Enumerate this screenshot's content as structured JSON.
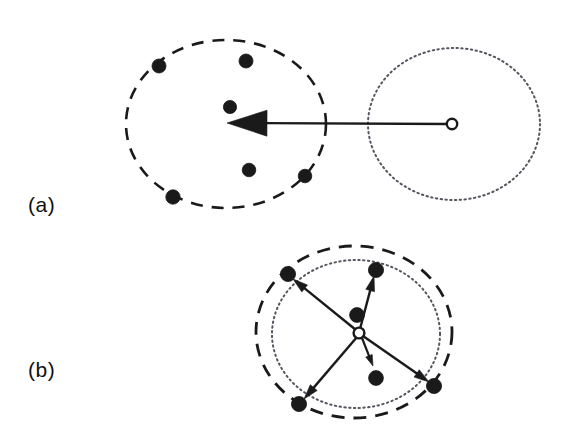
{
  "figure": {
    "width": 566,
    "height": 442,
    "background": "#ffffff",
    "ink_color": "#1a1a1a",
    "dotted_color": "#55555f"
  },
  "panels": [
    {
      "id": "panel-a",
      "label": "(a)",
      "label_position": {
        "x": 28,
        "y": 193
      },
      "description": "particle swarm inside dashed boundary with single long arrow from open circle at right toward swarm centre",
      "dashed_circle": {
        "name": "swarm-boundary-dashed",
        "cx": 226,
        "cy": 124,
        "rx": 100,
        "ry": 84,
        "stroke": "#1a1a1a",
        "stroke_width": 2.6,
        "dash": "12 9",
        "style": "dashed"
      },
      "dotted_circle": {
        "name": "target-boundary-dotted",
        "cx": 454,
        "cy": 124,
        "rx": 86,
        "ry": 76,
        "stroke": "#55555f",
        "stroke_width": 2.0,
        "dash": "1.4 3.4",
        "style": "dotted"
      },
      "open_circle": {
        "name": "reference-point-open-circle",
        "cx": 452,
        "cy": 124,
        "r": 5.2,
        "stroke": "#1a1a1a",
        "stroke_width": 2.4,
        "fill": "#ffffff"
      },
      "arrows": [
        {
          "name": "velocity-arrow-main",
          "x1": 447,
          "y1": 124,
          "x2": 227,
          "y2": 123,
          "stroke_width": 2.4,
          "head_length": 40,
          "head_width": 26
        }
      ],
      "particles": [
        {
          "name": "particle-1",
          "cx": 159,
          "cy": 66,
          "r": 7.0
        },
        {
          "name": "particle-2",
          "cx": 246,
          "cy": 61,
          "r": 7.0
        },
        {
          "name": "particle-3",
          "cx": 230,
          "cy": 107,
          "r": 6.6
        },
        {
          "name": "particle-4",
          "cx": 249,
          "cy": 170,
          "r": 6.8
        },
        {
          "name": "particle-5",
          "cx": 305,
          "cy": 176,
          "r": 6.8
        },
        {
          "name": "particle-6",
          "cx": 173,
          "cy": 197,
          "r": 7.2
        }
      ]
    },
    {
      "id": "panel-b",
      "label": "(b)",
      "label_position": {
        "x": 28,
        "y": 358
      },
      "description": "particles spread on overlapping dashed and dotted boundaries with five arrows radiating outward from central open circle",
      "dashed_circle": {
        "name": "swarm-boundary-dashed",
        "cx": 354,
        "cy": 332,
        "rx": 98,
        "ry": 86,
        "stroke": "#1a1a1a",
        "stroke_width": 2.8,
        "dash": "13 9",
        "style": "dashed"
      },
      "dotted_circle": {
        "name": "target-boundary-dotted",
        "cx": 356,
        "cy": 334,
        "rx": 84,
        "ry": 74,
        "stroke": "#55555f",
        "stroke_width": 2.0,
        "dash": "1.4 3.4",
        "style": "dotted"
      },
      "open_circle": {
        "name": "reference-point-open-circle",
        "cx": 359,
        "cy": 333,
        "r": 5.4,
        "stroke": "#1a1a1a",
        "stroke_width": 2.4,
        "fill": "#ffffff"
      },
      "arrows": [
        {
          "name": "velocity-arrow-upper-left",
          "x1": 356,
          "y1": 330,
          "x2": 293,
          "y2": 279,
          "stroke_width": 2.4,
          "head_length": 15,
          "head_width": 9
        },
        {
          "name": "velocity-arrow-upper-right",
          "x1": 360,
          "y1": 329,
          "x2": 374,
          "y2": 276,
          "stroke_width": 2.4,
          "head_length": 15,
          "head_width": 9
        },
        {
          "name": "velocity-arrow-lower-left",
          "x1": 357,
          "y1": 337,
          "x2": 304,
          "y2": 399,
          "stroke_width": 2.4,
          "head_length": 15,
          "head_width": 9
        },
        {
          "name": "velocity-arrow-lower-right",
          "x1": 363,
          "y1": 336,
          "x2": 429,
          "y2": 382,
          "stroke_width": 2.4,
          "head_length": 15,
          "head_width": 9
        },
        {
          "name": "velocity-arrow-short-down",
          "x1": 362,
          "y1": 338,
          "x2": 373,
          "y2": 366,
          "stroke_width": 2.2,
          "head_length": 11,
          "head_width": 7
        }
      ],
      "particles": [
        {
          "name": "particle-1",
          "cx": 288,
          "cy": 274,
          "r": 7.6
        },
        {
          "name": "particle-2",
          "cx": 376,
          "cy": 270,
          "r": 7.6
        },
        {
          "name": "particle-3",
          "cx": 357,
          "cy": 315,
          "r": 7.4
        },
        {
          "name": "particle-4",
          "cx": 376,
          "cy": 378,
          "r": 7.4
        },
        {
          "name": "particle-5",
          "cx": 299,
          "cy": 404,
          "r": 7.6
        },
        {
          "name": "particle-6",
          "cx": 434,
          "cy": 386,
          "r": 7.6
        }
      ]
    }
  ]
}
